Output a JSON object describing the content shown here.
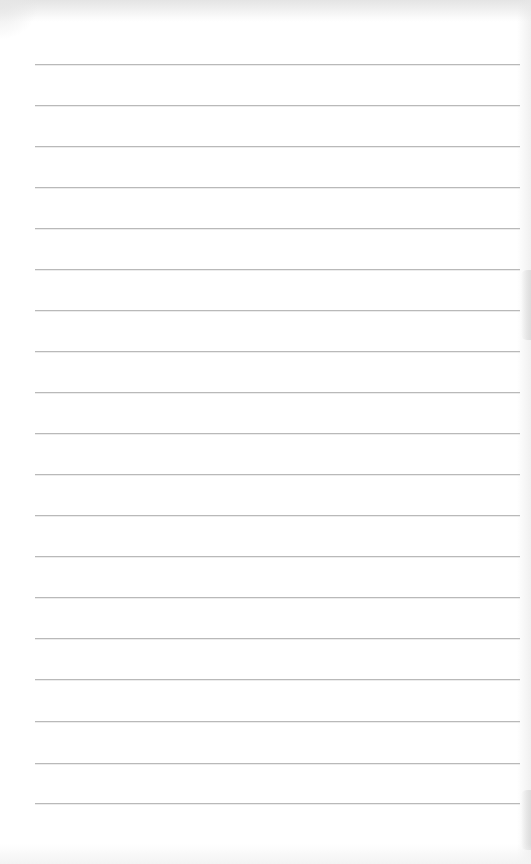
{
  "page": {
    "type": "lined-paper-scan",
    "background_color": "#ffffff",
    "line_color": "#b9b9b9",
    "line_count": 19,
    "line_left_px": 35,
    "line_right_px": 520,
    "line_positions_y": [
      64,
      105,
      146,
      187,
      228,
      269,
      310,
      351,
      392,
      433,
      474,
      515,
      556,
      597,
      638,
      679,
      721,
      763,
      803
    ]
  }
}
